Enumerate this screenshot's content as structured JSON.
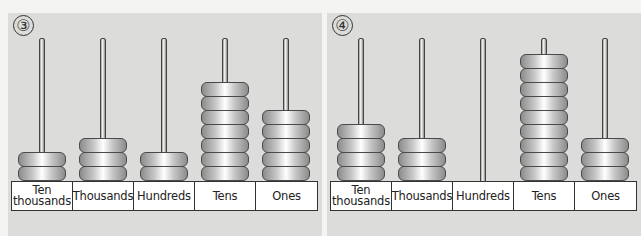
{
  "columns": [
    "Ten thousands",
    "Thousands",
    "Hundreds",
    "Tens",
    "Ones"
  ],
  "abacuses": [
    {
      "number": "③",
      "beads": [
        2,
        3,
        2,
        7,
        5
      ]
    },
    {
      "number": "④",
      "beads": [
        4,
        3,
        0,
        9,
        3
      ]
    }
  ],
  "colors": {
    "panel_bg": "#dcdcda",
    "page_bg": "#f4f4f2",
    "bead_outline": "#4a4a4a",
    "label_bg": "#ffffff"
  }
}
